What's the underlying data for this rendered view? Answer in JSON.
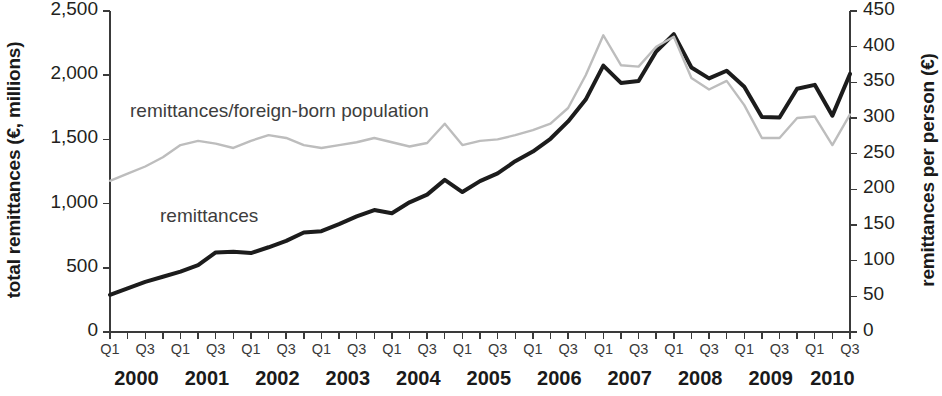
{
  "chart_data": {
    "type": "line",
    "title": "",
    "xlabel": "",
    "ylabel": "total remittances (€, millions)",
    "y2label": "remittances per person (€)",
    "grid": false,
    "legend_position": "inline-annotations",
    "ylim": [
      0,
      2500
    ],
    "y2lim": [
      0,
      450
    ],
    "yticks": [
      "0",
      "500",
      "1,000",
      "1,500",
      "2,000",
      "2,500"
    ],
    "ytick_values": [
      0,
      500,
      1000,
      1500,
      2000,
      2500
    ],
    "y2ticks": [
      "0",
      "50",
      "100",
      "150",
      "200",
      "250",
      "300",
      "350",
      "400",
      "450"
    ],
    "y2tick_values": [
      0,
      50,
      100,
      150,
      200,
      250,
      300,
      350,
      400,
      450
    ],
    "x": [
      "2000Q1",
      "2000Q2",
      "2000Q3",
      "2000Q4",
      "2001Q1",
      "2001Q2",
      "2001Q3",
      "2001Q4",
      "2002Q1",
      "2002Q2",
      "2002Q3",
      "2002Q4",
      "2003Q1",
      "2003Q2",
      "2003Q3",
      "2003Q4",
      "2004Q1",
      "2004Q2",
      "2004Q3",
      "2004Q4",
      "2005Q1",
      "2005Q2",
      "2005Q3",
      "2005Q4",
      "2006Q1",
      "2006Q2",
      "2006Q3",
      "2006Q4",
      "2007Q1",
      "2007Q2",
      "2007Q3",
      "2007Q4",
      "2008Q1",
      "2008Q2",
      "2008Q3",
      "2008Q4",
      "2009Q1",
      "2009Q2",
      "2009Q3",
      "2009Q4",
      "2010Q1",
      "2010Q2",
      "2010Q3"
    ],
    "xtick_labels": [
      "Q1",
      "Q3",
      "Q1",
      "Q3",
      "Q1",
      "Q3",
      "Q1",
      "Q3",
      "Q1",
      "Q3",
      "Q1",
      "Q3",
      "Q1",
      "Q3",
      "Q1",
      "Q3",
      "Q1",
      "Q3",
      "Q1",
      "Q3",
      "Q1",
      "Q3"
    ],
    "xtick_indices": [
      0,
      2,
      4,
      6,
      8,
      10,
      12,
      14,
      16,
      18,
      20,
      22,
      24,
      26,
      28,
      30,
      32,
      34,
      36,
      38,
      40,
      42
    ],
    "year_labels": [
      "2000",
      "2001",
      "2002",
      "2003",
      "2004",
      "2005",
      "2006",
      "2007",
      "2008",
      "2009",
      "2010"
    ],
    "year_center_indices": [
      1.5,
      5.5,
      9.5,
      13.5,
      17.5,
      21.5,
      25.5,
      29.5,
      33.5,
      37.5,
      41.0
    ],
    "series": [
      {
        "name": "remittances",
        "axis": "left",
        "color": "#1c1c1c",
        "width": 4.0,
        "annotation": "remittances",
        "values": [
          290,
          340,
          390,
          430,
          470,
          520,
          620,
          625,
          615,
          660,
          710,
          775,
          785,
          840,
          900,
          950,
          925,
          1010,
          1070,
          1185,
          1090,
          1175,
          1235,
          1330,
          1405,
          1505,
          1640,
          1810,
          2075,
          1940,
          1955,
          2185,
          2320,
          2060,
          1975,
          2035,
          1910,
          1675,
          1670,
          1895,
          1925,
          1685,
          2010
        ]
      },
      {
        "name": "remittances/foreign-born population",
        "axis": "right",
        "color": "#bdbdbd",
        "width": 2.4,
        "annotation": "remittances/foreign-born population",
        "values": [
          212,
          222,
          232,
          245,
          262,
          268,
          264,
          258,
          268,
          276,
          272,
          262,
          258,
          262,
          266,
          272,
          266,
          260,
          265,
          292,
          262,
          268,
          270,
          276,
          283,
          292,
          314,
          360,
          416,
          374,
          372,
          400,
          414,
          356,
          340,
          352,
          318,
          272,
          272,
          300,
          302,
          262,
          305
        ]
      }
    ],
    "annotations": [
      {
        "text": "remittances/foreign-born population",
        "x_px": 130,
        "y_px": 100
      },
      {
        "text": "remittances",
        "x_px": 160,
        "y_px": 205
      }
    ]
  },
  "figure": {
    "plot_left_px": 110,
    "plot_right_px": 850,
    "plot_top_px": 11,
    "plot_bottom_px": 332,
    "background": "#ffffff",
    "axis_color": "#3a3a3a"
  }
}
